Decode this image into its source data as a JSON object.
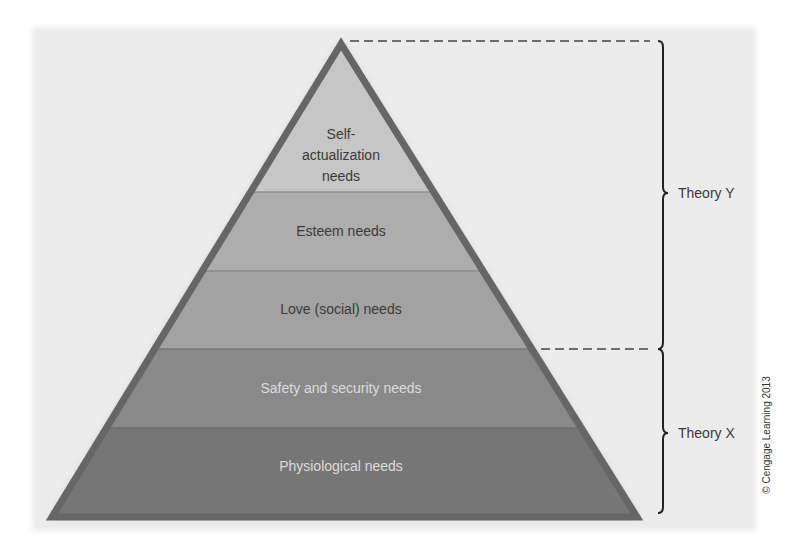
{
  "diagram": {
    "type": "pyramid",
    "levels": [
      {
        "id": "self-actualization",
        "label_lines": [
          "Self-",
          "actualization",
          "needs"
        ],
        "color": "#c6c6c6",
        "text_color": "#3a3a3a"
      },
      {
        "id": "esteem",
        "label": "Esteem needs",
        "color": "#adadad",
        "text_color": "#3a3a3a"
      },
      {
        "id": "love",
        "label": "Love (social) needs",
        "color": "#a2a2a2",
        "text_color": "#3a3a3a"
      },
      {
        "id": "safety",
        "label": "Safety and security needs",
        "color": "#898989",
        "text_color": "#dcdcdc"
      },
      {
        "id": "physiological",
        "label": "Physiological needs",
        "color": "#767676",
        "text_color": "#dcdcdc"
      }
    ],
    "outline_color": "#666666",
    "brackets": [
      {
        "label": "Theory Y",
        "spans_levels": [
          "self-actualization",
          "esteem",
          "love"
        ]
      },
      {
        "label": "Theory X",
        "spans_levels": [
          "safety",
          "physiological"
        ]
      }
    ],
    "copyright": "© Cengage Learning 2013",
    "background_color": "#ececec"
  }
}
